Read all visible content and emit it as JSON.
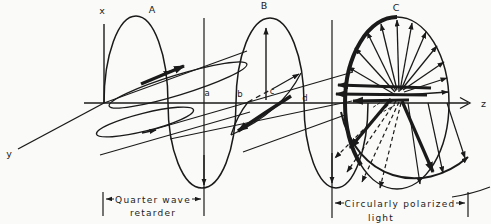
{
  "figure": {
    "axis_labels": {
      "x": "x",
      "y": "y",
      "z": "z"
    },
    "section_labels": {
      "A": "A",
      "B": "B",
      "C": "C"
    },
    "point_labels": {
      "a": "a",
      "b": "b",
      "c": "c",
      "d": "d"
    },
    "annotations": {
      "retarder_line1": "Quarter wave",
      "retarder_line2": "retarder",
      "circular_line1": "Circularly polarized",
      "circular_line2": "light"
    },
    "colors": {
      "ink": "#1a1a1a",
      "background": "#fafaf8"
    }
  }
}
